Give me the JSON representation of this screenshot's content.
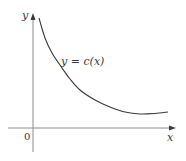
{
  "chart_data": {
    "type": "line",
    "title": "",
    "xlabel": "x",
    "ylabel": "y",
    "origin_label": "0",
    "series": [
      {
        "name": "y = c(x)",
        "description": "decreasing convex curve, steep near x=0, reaching a minimum then rising slightly",
        "points_px": [
          [
            39,
            18
          ],
          [
            45,
            38
          ],
          [
            52,
            53
          ],
          [
            60,
            65
          ],
          [
            70,
            79
          ],
          [
            80,
            90
          ],
          [
            95,
            100
          ],
          [
            110,
            107
          ],
          [
            125,
            112
          ],
          [
            140,
            114
          ],
          [
            155,
            113.5
          ],
          [
            168,
            112
          ]
        ]
      }
    ],
    "annotations": [
      {
        "text": "y = c(x)",
        "position": "above curve, center-left"
      }
    ],
    "grid": false,
    "ticks": false,
    "legend": "none"
  },
  "labels": {
    "y_axis": "y",
    "x_axis": "x",
    "origin": "0",
    "curve": "y = c(x)"
  },
  "colors": {
    "axis": "#8a8a8a",
    "curve": "#3a3a3a",
    "text": "#3a3a3a"
  }
}
